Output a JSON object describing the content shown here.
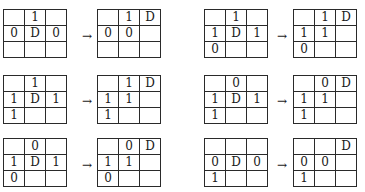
{
  "arrow_symbol": "→",
  "transitions": [
    {
      "before": [
        [
          "",
          "1",
          ""
        ],
        [
          "0",
          "D",
          "0"
        ],
        [
          "",
          "",
          ""
        ]
      ],
      "after": [
        [
          "",
          "1",
          "D"
        ],
        [
          "0",
          "0",
          ""
        ],
        [
          "",
          "",
          ""
        ]
      ]
    },
    {
      "before": [
        [
          "",
          "1",
          ""
        ],
        [
          "1",
          "D",
          "1"
        ],
        [
          "0",
          "",
          ""
        ]
      ],
      "after": [
        [
          "",
          "1",
          "D"
        ],
        [
          "1",
          "1",
          ""
        ],
        [
          "0",
          "",
          ""
        ]
      ]
    },
    {
      "before": [
        [
          "",
          "1",
          ""
        ],
        [
          "1",
          "D",
          "1"
        ],
        [
          "1",
          "",
          ""
        ]
      ],
      "after": [
        [
          "",
          "1",
          "D"
        ],
        [
          "1",
          "1",
          ""
        ],
        [
          "1",
          "",
          ""
        ]
      ]
    },
    {
      "before": [
        [
          "",
          "0",
          ""
        ],
        [
          "1",
          "D",
          "1"
        ],
        [
          "1",
          "",
          ""
        ]
      ],
      "after": [
        [
          "",
          "0",
          "D"
        ],
        [
          "1",
          "1",
          ""
        ],
        [
          "1",
          "",
          ""
        ]
      ]
    },
    {
      "before": [
        [
          "",
          "0",
          ""
        ],
        [
          "1",
          "D",
          "1"
        ],
        [
          "0",
          "",
          ""
        ]
      ],
      "after": [
        [
          "",
          "0",
          "D"
        ],
        [
          "1",
          "1",
          ""
        ],
        [
          "0",
          "",
          ""
        ]
      ]
    },
    {
      "before": [
        [
          "",
          "",
          ""
        ],
        [
          "0",
          "D",
          "0"
        ],
        [
          "1",
          "",
          ""
        ]
      ],
      "after": [
        [
          "",
          "",
          "D"
        ],
        [
          "0",
          "0",
          ""
        ],
        [
          "1",
          "",
          ""
        ]
      ]
    }
  ]
}
